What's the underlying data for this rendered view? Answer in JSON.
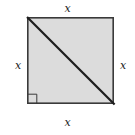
{
  "figure": {
    "kind": "geometry-diagram",
    "shape": "square",
    "fill_color": "#dcdcdc",
    "stroke_color": "#3a3a3a",
    "diagonal_color": "#1e1e1e",
    "background_color": "#ffffff",
    "square": {
      "x": 27,
      "y": 17,
      "size": 87,
      "stroke_width": 1.6
    },
    "diagonal": {
      "x1": 27,
      "y1": 17,
      "x2": 114,
      "y2": 104,
      "stroke_width": 2.2
    },
    "right_angle_marker": {
      "corner": "bottom-left",
      "x": 27,
      "y": 104,
      "size": 9,
      "stroke_width": 1
    },
    "labels": {
      "top": "x",
      "right": "x",
      "bottom": "x",
      "left": "x"
    }
  }
}
